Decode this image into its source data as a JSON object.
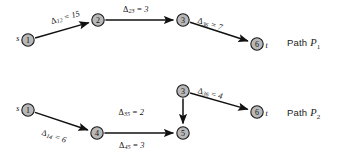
{
  "figure": {
    "type": "directed-graph-paths",
    "background_color": "#ffffff",
    "node_fill": "#b8b8b8",
    "node_stroke": "#1a1a1a",
    "edge_color": "#111111"
  },
  "paths": [
    {
      "id": "P1",
      "caption_prefix": "Path",
      "caption_symbol": "P",
      "caption_subscript": "1",
      "source_label": "s",
      "sink_label": "t",
      "nodes": [
        {
          "id": "1",
          "label": "1",
          "x": 28,
          "y": 40,
          "endpoint": "source"
        },
        {
          "id": "2",
          "label": "2",
          "x": 98,
          "y": 20,
          "endpoint": "none"
        },
        {
          "id": "3",
          "label": "3",
          "x": 183,
          "y": 20,
          "endpoint": "none"
        },
        {
          "id": "6",
          "label": "6",
          "x": 257,
          "y": 44,
          "endpoint": "sink"
        }
      ],
      "edges": [
        {
          "from": "1",
          "to": "2",
          "symbol": "Δ",
          "subscript": "12",
          "value": "15",
          "label": "Δ12 = 15",
          "label_x": 51,
          "label_y": 21,
          "rotate": -16
        },
        {
          "from": "2",
          "to": "3",
          "symbol": "Δ",
          "subscript": "23",
          "value": "3",
          "label": "Δ23 = 3",
          "label_x": 123,
          "label_y": 9,
          "rotate": 0
        },
        {
          "from": "3",
          "to": "6",
          "symbol": "Δ",
          "subscript": "36",
          "value": "7",
          "label": "Δ36 = 7",
          "label_x": 198,
          "label_y": 20,
          "rotate": 17
        }
      ]
    },
    {
      "id": "P2",
      "caption_prefix": "Path",
      "caption_symbol": "P",
      "caption_subscript": "2",
      "source_label": "s",
      "sink_label": "t",
      "nodes": [
        {
          "id": "1",
          "label": "1",
          "x": 28,
          "y": 110,
          "endpoint": "source"
        },
        {
          "id": "4",
          "label": "4",
          "x": 97,
          "y": 133,
          "endpoint": "none"
        },
        {
          "id": "5",
          "label": "5",
          "x": 183,
          "y": 133,
          "endpoint": "none"
        },
        {
          "id": "3",
          "label": "3",
          "x": 183,
          "y": 91,
          "endpoint": "none"
        },
        {
          "id": "6",
          "label": "6",
          "x": 257,
          "y": 112,
          "endpoint": "sink"
        }
      ],
      "edges": [
        {
          "from": "1",
          "to": "4",
          "symbol": "Δ",
          "subscript": "14",
          "value": "6",
          "label": "Δ14 = 6",
          "label_x": 42,
          "label_y": 132,
          "rotate": 18
        },
        {
          "from": "4",
          "to": "5",
          "symbol": "Δ",
          "subscript": "45",
          "value": "3",
          "label": "Δ45 = 3",
          "label_x": 119,
          "label_y": 145,
          "rotate": 0
        },
        {
          "from": "3",
          "to": "5",
          "symbol": "Δ",
          "subscript": "35",
          "value": "2",
          "label": "Δ35 = 2",
          "label_x": 144,
          "label_y": 112,
          "rotate": 0,
          "anchor": "end"
        },
        {
          "from": "3",
          "to": "6",
          "symbol": "Δ",
          "subscript": "36",
          "value": "4",
          "label": "Δ36 = 4",
          "label_x": 198,
          "label_y": 90,
          "rotate": 14
        }
      ]
    }
  ],
  "captions": [
    {
      "name": "path-p1-caption",
      "prefix": "Path",
      "symbol": "P",
      "subscript": "1",
      "x": 287,
      "y": 37
    },
    {
      "name": "path-p2-caption",
      "prefix": "Path",
      "symbol": "P",
      "subscript": "2",
      "x": 287,
      "y": 107
    }
  ]
}
